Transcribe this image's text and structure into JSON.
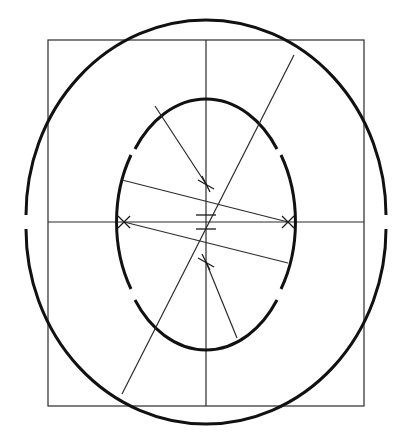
{
  "colors": {
    "background": "#ffffff",
    "construction_line": "#2a2a2a",
    "outline_stroke": "#111111"
  },
  "elements": {
    "square": "construction square",
    "outer_circle": "outer contour of letter O (broken at horizontal axis)",
    "inner_ellipse": "inner counter of letter O (broken on both sides)",
    "axes": [
      "vertical center axis",
      "horizontal center axis"
    ],
    "diagonals": [
      "main stress diagonal",
      "upper-left radial",
      "lower-right radial",
      "upper transverse",
      "lower transverse"
    ],
    "marks": [
      "upper cross",
      "lower cross",
      "left cross",
      "right cross",
      "center tick upper",
      "center tick lower"
    ]
  }
}
